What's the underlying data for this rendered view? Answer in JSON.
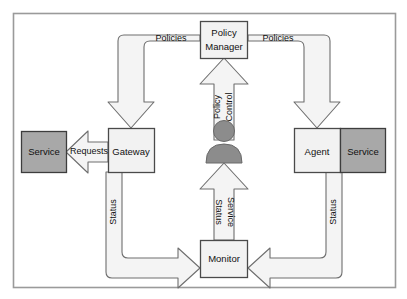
{
  "diagram": {
    "frame": {
      "stroke": "#9a9a9a"
    },
    "colors": {
      "node_fill": "#f2f2f2",
      "node_stroke": "#4a4a4a",
      "service_fill": "#a8a8a8",
      "service_stroke": "#3d3d3d",
      "arrow_fill": "#f4f4f4",
      "arrow_stroke": "#6e6e6e",
      "person_fill": "#8c8c8c",
      "person_stroke": "#6a6a6a",
      "text": "#111111"
    },
    "nodes": [
      {
        "id": "policy-manager",
        "label_line1": "Policy",
        "label_line2": "Manager",
        "kind": "component"
      },
      {
        "id": "gateway",
        "label": "Gateway",
        "kind": "component"
      },
      {
        "id": "agent",
        "label": "Agent",
        "kind": "component"
      },
      {
        "id": "monitor",
        "label": "Monitor",
        "kind": "component"
      },
      {
        "id": "service-left",
        "label": "Service",
        "kind": "service"
      },
      {
        "id": "service-right",
        "label": "Service",
        "kind": "service"
      },
      {
        "id": "administrator",
        "label": "",
        "kind": "actor"
      }
    ],
    "edges": [
      {
        "id": "policies-left",
        "label": "Policies",
        "from": "policy-manager",
        "to": "gateway"
      },
      {
        "id": "policies-right",
        "label": "Policies",
        "from": "policy-manager",
        "to": "agent"
      },
      {
        "id": "policy-control",
        "label_line1": "Policy",
        "label_line2": "Control",
        "from": "administrator",
        "to": "policy-manager"
      },
      {
        "id": "service-status",
        "label_line1": "Service",
        "label_line2": "Status",
        "from": "monitor",
        "to": "administrator"
      },
      {
        "id": "requests",
        "label": "Requests",
        "from": "gateway",
        "to": "service-left"
      },
      {
        "id": "status-left",
        "label": "Status",
        "from": "gateway",
        "to": "monitor"
      },
      {
        "id": "status-right",
        "label": "Status",
        "from": "agent",
        "to": "monitor"
      }
    ]
  }
}
